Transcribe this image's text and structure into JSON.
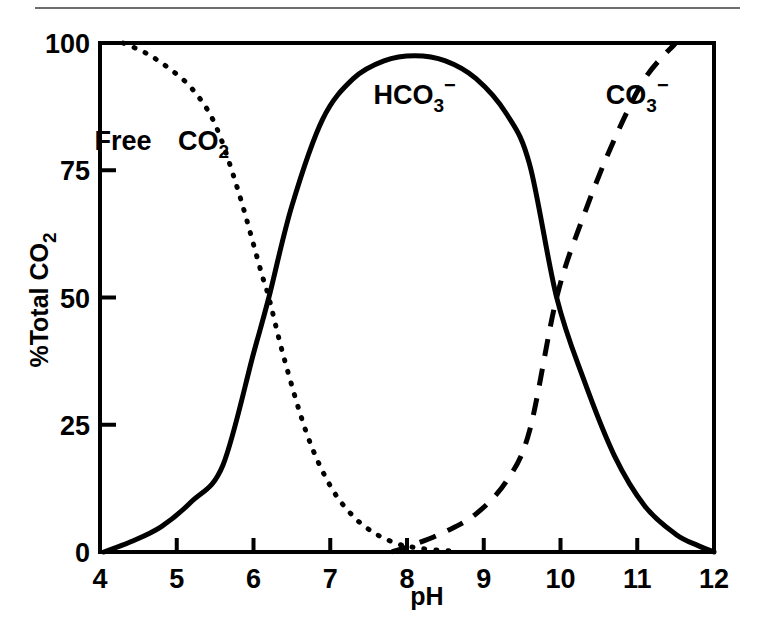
{
  "figure": {
    "background_color": "#ffffff",
    "ink_color": "#000000",
    "rule_color": "#6d6d6d"
  },
  "chart_data": {
    "type": "line",
    "title": "",
    "subtitle": "",
    "xlabel": "pH",
    "ylabel": "%Total CO2",
    "ylabel_parts": {
      "main": "%Total CO",
      "sub": "2"
    },
    "xlim": [
      4,
      12
    ],
    "ylim": [
      0,
      100
    ],
    "xticks": [
      4,
      5,
      6,
      7,
      8,
      9,
      10,
      11,
      12
    ],
    "xtick_labels": [
      "4",
      "5",
      "6",
      "7",
      "8",
      "9",
      "10",
      "11",
      "12"
    ],
    "yticks": [
      0,
      25,
      50,
      75,
      100
    ],
    "ytick_labels": [
      "0",
      "25",
      "50",
      "75",
      "100"
    ],
    "grid": false,
    "legend": "inline-annotations",
    "annotations": [
      {
        "text": "Free",
        "x": 4.3,
        "y": 79,
        "parts": {
          "main": "Free"
        }
      },
      {
        "text": "CO2",
        "x": 5.35,
        "y": 79,
        "parts": {
          "main": "CO",
          "sub": "2"
        }
      },
      {
        "text": "HCO3-",
        "x": 8.1,
        "y": 88,
        "parts": {
          "main": "HCO",
          "sub": "3",
          "sup": "−"
        }
      },
      {
        "text": "CO3-",
        "x": 11.0,
        "y": 88,
        "parts": {
          "main": "CO",
          "sub": "3",
          "sup": "−"
        }
      }
    ],
    "series": [
      {
        "name": "Free CO2",
        "style": "dotted",
        "x": [
          4.3,
          4.6,
          4.9,
          5.2,
          5.5,
          5.8,
          6.1,
          6.2,
          6.4,
          6.7,
          7.0,
          7.3,
          7.6,
          7.9,
          8.1,
          8.3,
          8.6
        ],
        "values": [
          100,
          98,
          95,
          91,
          84,
          71,
          55,
          50,
          38,
          23,
          13,
          7,
          3.5,
          1.5,
          0.9,
          0.5,
          0.2
        ]
      },
      {
        "name": "HCO3-",
        "style": "solid",
        "x": [
          4.05,
          4.4,
          4.8,
          5.2,
          5.6,
          6.0,
          6.2,
          6.5,
          6.9,
          7.3,
          7.7,
          8.1,
          8.5,
          8.9,
          9.3,
          9.6,
          9.95,
          10.3,
          10.7,
          11.1,
          11.5,
          11.8,
          12.0
        ],
        "values": [
          0,
          2,
          5,
          10,
          17,
          39,
          50,
          68,
          85,
          93,
          96.5,
          97.5,
          96.5,
          93,
          86,
          76,
          50,
          34,
          19,
          9,
          3.5,
          1.2,
          0
        ]
      },
      {
        "name": "CO3-",
        "style": "dashed",
        "x": [
          7.8,
          8.1,
          8.5,
          8.9,
          9.3,
          9.6,
          9.95,
          10.3,
          10.7,
          11.1,
          11.5
        ],
        "values": [
          0,
          1.5,
          4,
          7.5,
          14,
          24,
          50,
          66,
          81,
          93,
          100
        ]
      }
    ]
  }
}
